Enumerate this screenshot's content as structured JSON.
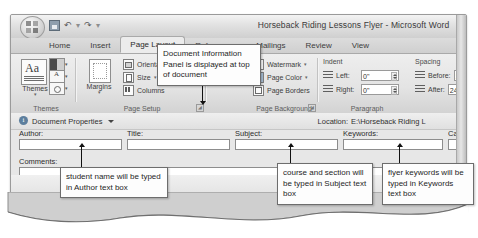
{
  "window": {
    "title": "Horseback Riding Lessons Flyer - Microsoft Word",
    "office_button": "office-orb",
    "quick_access": [
      "save",
      "undo",
      "redo",
      "customize"
    ]
  },
  "ribbon": {
    "tabs": [
      {
        "label": "Home",
        "active": false
      },
      {
        "label": "Insert",
        "active": false
      },
      {
        "label": "Page Layout",
        "active": true
      },
      {
        "label": "References",
        "active": false
      },
      {
        "label": "Mailings",
        "active": false
      },
      {
        "label": "Review",
        "active": false
      },
      {
        "label": "View",
        "active": false
      }
    ],
    "groups": {
      "themes": {
        "label": "Themes",
        "big_button": "Themes",
        "gallery_items": [
          "theme-colors",
          "theme-fonts",
          "theme-effects"
        ]
      },
      "page_setup": {
        "label": "Page Setup",
        "margins": "Margins",
        "items": [
          "Orientat",
          "Size",
          "Columns"
        ]
      },
      "page_background": {
        "label": "Page Background",
        "items": [
          "Watermark",
          "Page Color",
          "Page Borders"
        ]
      },
      "paragraph": {
        "label": "Paragraph",
        "indent_heading": "Indent",
        "indent_left_label": "Left:",
        "indent_left_value": "0\"",
        "indent_right_label": "Right:",
        "indent_right_value": "0\"",
        "spacing_heading": "Spacing",
        "spacing_before_label": "Before:",
        "spacing_before_value": "10",
        "spacing_after_label": "After:",
        "spacing_after_value": "24"
      }
    }
  },
  "document_information_panel": {
    "title": "Document Properties",
    "location_label": "Location:",
    "location_value": "E:\\Horseback Riding L",
    "fields": [
      {
        "label": "Author:",
        "value": "",
        "placeholder": ""
      },
      {
        "label": "Title:",
        "value": "",
        "placeholder": ""
      },
      {
        "label": "Subject:",
        "value": "",
        "placeholder": ""
      },
      {
        "label": "Keywords:",
        "value": "",
        "placeholder": ""
      },
      {
        "label": "Ca",
        "value": "",
        "placeholder": ""
      }
    ],
    "comments_label": "Comments:",
    "comments_value": ""
  },
  "callouts": [
    {
      "id": "dip-callout",
      "text": "Document Information Panel is displayed at top of document"
    },
    {
      "id": "author-callout",
      "text": "student name will be typed in Author text box"
    },
    {
      "id": "subject-callout",
      "text": "course and section will be typed in Subject text box"
    },
    {
      "id": "keywords-callout",
      "text": "flyer keywords will be typed in Keywords text box"
    }
  ],
  "colors": {
    "window_chrome": "#d9d9d9",
    "ribbon": "#e4e4e4",
    "panel": "#e7e7e7",
    "callout_border": "#6d6d6d",
    "accent_blue": "#5d7f9e"
  }
}
